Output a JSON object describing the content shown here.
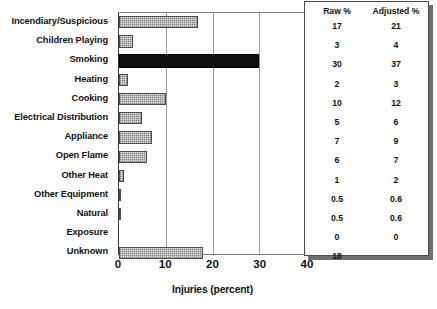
{
  "chart_data": {
    "type": "bar",
    "orientation": "horizontal",
    "title": "",
    "xlabel": "Injuries (percent)",
    "ylabel": "",
    "xlim": [
      0,
      40
    ],
    "xticks": [
      0,
      10,
      20,
      30,
      40
    ],
    "grid": true,
    "gridlines_at": [
      10,
      20,
      30
    ],
    "legend": "none",
    "categories": [
      "Incendiary/Suspicious",
      "Children Playing",
      "Smoking",
      "Heating",
      "Cooking",
      "Electrical Distribution",
      "Appliance",
      "Open Flame",
      "Other Heat",
      "Other Equipment",
      "Natural",
      "Exposure",
      "Unknown"
    ],
    "values": [
      17,
      3,
      30,
      2,
      10,
      5,
      7,
      6,
      1,
      0.5,
      0.5,
      0,
      18
    ],
    "highlighted_category": "Smoking",
    "bar_style": {
      "fill": "#e9e9e9",
      "pattern": "stipple",
      "edge": "#4a4a4a",
      "highlight_fill": "#111111"
    }
  },
  "table": {
    "headers": [
      "Raw %",
      "Adjusted %"
    ],
    "rows": [
      {
        "raw": "17",
        "adjusted": "21"
      },
      {
        "raw": "3",
        "adjusted": "4"
      },
      {
        "raw": "30",
        "adjusted": "37"
      },
      {
        "raw": "2",
        "adjusted": "3"
      },
      {
        "raw": "10",
        "adjusted": "12"
      },
      {
        "raw": "5",
        "adjusted": "6"
      },
      {
        "raw": "7",
        "adjusted": "9"
      },
      {
        "raw": "6",
        "adjusted": "7"
      },
      {
        "raw": "1",
        "adjusted": "2"
      },
      {
        "raw": "0.5",
        "adjusted": "0.6"
      },
      {
        "raw": "0.5",
        "adjusted": "0.6"
      },
      {
        "raw": "0",
        "adjusted": "0"
      },
      {
        "raw": "18",
        "adjusted": ""
      }
    ]
  }
}
